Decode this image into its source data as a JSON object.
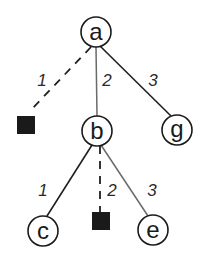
{
  "diagram": {
    "type": "tree",
    "nodes": [
      {
        "id": "a",
        "label": "a",
        "kind": "circle",
        "cx": 96,
        "cy": 32
      },
      {
        "id": "b",
        "label": "b",
        "kind": "circle",
        "cx": 97,
        "cy": 131
      },
      {
        "id": "g",
        "label": "g",
        "kind": "circle",
        "cx": 177,
        "cy": 130
      },
      {
        "id": "c",
        "label": "c",
        "kind": "circle",
        "cx": 43,
        "cy": 231
      },
      {
        "id": "e",
        "label": "e",
        "kind": "circle",
        "cx": 153,
        "cy": 230
      },
      {
        "id": "leaf1",
        "label": "",
        "kind": "filled-square",
        "x": 17,
        "y": 116,
        "size": 18
      },
      {
        "id": "leaf2",
        "label": "",
        "kind": "filled-square",
        "x": 92,
        "y": 212,
        "size": 18
      }
    ],
    "edges": [
      {
        "from": "a",
        "to": "leaf1",
        "label": "1",
        "style": "dashed"
      },
      {
        "from": "a",
        "to": "b",
        "label": "2",
        "style": "solid"
      },
      {
        "from": "a",
        "to": "g",
        "label": "3",
        "style": "solid"
      },
      {
        "from": "b",
        "to": "c",
        "label": "1",
        "style": "solid"
      },
      {
        "from": "b",
        "to": "leaf2",
        "label": "2",
        "style": "dashed"
      },
      {
        "from": "b",
        "to": "e",
        "label": "3",
        "style": "solid"
      }
    ],
    "labels": {
      "node_a": "a",
      "node_b": "b",
      "node_g": "g",
      "node_c": "c",
      "node_e": "e",
      "edge_a_leaf1": "1",
      "edge_a_b": "2",
      "edge_a_g": "3",
      "edge_b_c": "1",
      "edge_b_leaf2": "2",
      "edge_b_e": "3"
    }
  }
}
